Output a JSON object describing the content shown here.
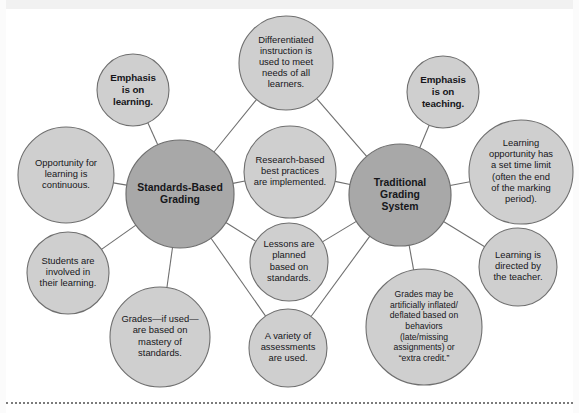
{
  "diagram": {
    "type": "bubble-concept-map",
    "colors": {
      "hub_fill": "#a8a8a8",
      "satellite_fill": "#cfcfcf",
      "stroke": "#6f6f6f",
      "text": "#16161a",
      "background": "#ffffff",
      "rule": "#7b7b7b"
    },
    "hubs": [
      {
        "id": "standards-based-grading",
        "label": "Standards-Based Grading",
        "lines": [
          "Standards-Based",
          "Grading"
        ],
        "cx": 180,
        "cy": 194,
        "r": 54
      },
      {
        "id": "traditional-grading-system",
        "label": "Traditional Grading System",
        "lines": [
          "Traditional",
          "Grading",
          "System"
        ],
        "cx": 400,
        "cy": 195,
        "r": 51
      }
    ],
    "satellites": [
      {
        "id": "emphasis-on-learning",
        "hub": "standards-based-grading",
        "label": "Emphasis is on learning.",
        "lines": [
          "Emphasis",
          "is on",
          "learning."
        ],
        "cx": 133,
        "cy": 90,
        "r": 36,
        "style": "emphasis"
      },
      {
        "id": "opportunity-continuous",
        "hub": "standards-based-grading",
        "label": "Opportunity for learning is continuous.",
        "lines": [
          "Opportunity for",
          "learning is",
          "continuous."
        ],
        "cx": 66,
        "cy": 175,
        "r": 48,
        "style": "normal"
      },
      {
        "id": "students-involved",
        "hub": "standards-based-grading",
        "label": "Students are involved in their learning.",
        "lines": [
          "Students are",
          "involved in",
          "their learning."
        ],
        "cx": 68,
        "cy": 273,
        "r": 41,
        "style": "normal"
      },
      {
        "id": "grades-mastery",
        "hub": "standards-based-grading",
        "label": "Grades—if used—are based on mastery of standards.",
        "lines": [
          "Grades—if used—",
          "are based on",
          "mastery of",
          "standards."
        ],
        "cx": 160,
        "cy": 337,
        "r": 50,
        "style": "normal"
      },
      {
        "id": "differentiated-instruction",
        "hub": "both",
        "label": "Differentiated instruction is used to meet needs of all learners.",
        "lines": [
          "Differentiated",
          "instruction is",
          "used to meet",
          "needs of all",
          "learners."
        ],
        "cx": 286,
        "cy": 63,
        "r": 47,
        "style": "normal"
      },
      {
        "id": "research-based-practices",
        "hub": "both",
        "label": "Research-based best practices are implemented.",
        "lines": [
          "Research-based",
          "best practices",
          "are implemented."
        ],
        "cx": 290,
        "cy": 172,
        "r": 46,
        "style": "normal"
      },
      {
        "id": "lessons-planned-standards",
        "hub": "both",
        "label": "Lessons are planned based on standards.",
        "lines": [
          "Lessons are",
          "planned",
          "based on",
          "standards."
        ],
        "cx": 289,
        "cy": 262,
        "r": 39,
        "style": "normal"
      },
      {
        "id": "variety-of-assessments",
        "hub": "both",
        "label": "A variety of assessments are used.",
        "lines": [
          "A variety of",
          "assessments",
          "are used."
        ],
        "cx": 288,
        "cy": 348,
        "r": 39,
        "style": "normal"
      },
      {
        "id": "emphasis-on-teaching",
        "hub": "traditional-grading-system",
        "label": "Emphasis is on teaching.",
        "lines": [
          "Emphasis",
          "is on",
          "teaching."
        ],
        "cx": 443,
        "cy": 92,
        "r": 36,
        "style": "emphasis"
      },
      {
        "id": "set-time-limit",
        "hub": "traditional-grading-system",
        "label": "Learning opportunity has a set time limit (often the end of the marking period).",
        "lines": [
          "Learning",
          "opportunity has",
          "a set time limit",
          "(often the end",
          "of the marking",
          "period)."
        ],
        "cx": 521,
        "cy": 172,
        "r": 52,
        "style": "normal"
      },
      {
        "id": "teacher-directed",
        "hub": "traditional-grading-system",
        "label": "Learning is directed by the teacher.",
        "lines": [
          "Learning is",
          "directed by",
          "the teacher."
        ],
        "cx": 518,
        "cy": 267,
        "r": 39,
        "style": "normal"
      },
      {
        "id": "grades-inflated-deflated",
        "hub": "traditional-grading-system",
        "label": "Grades may be artificially inflated/deflated based on behaviors (late/missing assignments) or “extra credit.”",
        "lines": [
          "Grades may be",
          "artificially inflated/",
          "deflated based on",
          "behaviors",
          "(late/missing",
          "assignments) or",
          "“extra credit.”"
        ],
        "cx": 424,
        "cy": 327,
        "r": 58,
        "style": "small"
      }
    ],
    "connectors": [
      {
        "id": "sbg-emphasis-learning",
        "from": "standards-based-grading",
        "to": "emphasis-on-learning"
      },
      {
        "id": "sbg-opportunity",
        "from": "standards-based-grading",
        "to": "opportunity-continuous"
      },
      {
        "id": "sbg-students-involved",
        "from": "standards-based-grading",
        "to": "students-involved"
      },
      {
        "id": "sbg-grades-mastery",
        "from": "standards-based-grading",
        "to": "grades-mastery"
      },
      {
        "id": "sbg-differentiated",
        "from": "standards-based-grading",
        "to": "differentiated-instruction"
      },
      {
        "id": "sbg-research",
        "from": "standards-based-grading",
        "to": "research-based-practices"
      },
      {
        "id": "sbg-lessons",
        "from": "standards-based-grading",
        "to": "lessons-planned-standards"
      },
      {
        "id": "sbg-assessments",
        "from": "standards-based-grading",
        "to": "variety-of-assessments"
      },
      {
        "id": "tgs-differentiated",
        "from": "traditional-grading-system",
        "to": "differentiated-instruction"
      },
      {
        "id": "tgs-research",
        "from": "traditional-grading-system",
        "to": "research-based-practices"
      },
      {
        "id": "tgs-lessons",
        "from": "traditional-grading-system",
        "to": "lessons-planned-standards"
      },
      {
        "id": "tgs-assessments",
        "from": "traditional-grading-system",
        "to": "variety-of-assessments"
      },
      {
        "id": "tgs-emphasis-teaching",
        "from": "traditional-grading-system",
        "to": "emphasis-on-teaching"
      },
      {
        "id": "tgs-time-limit",
        "from": "traditional-grading-system",
        "to": "set-time-limit"
      },
      {
        "id": "tgs-teacher-directed",
        "from": "traditional-grading-system",
        "to": "teacher-directed"
      },
      {
        "id": "tgs-grades-inflated",
        "from": "traditional-grading-system",
        "to": "grades-inflated-deflated"
      }
    ]
  }
}
